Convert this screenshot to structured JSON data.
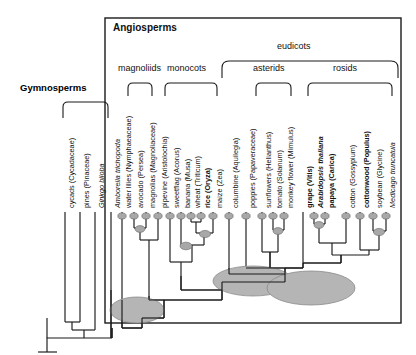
{
  "figure": {
    "title_labels": {
      "gymnosperms": "Gymnosperms",
      "angiosperms": "Angiosperms",
      "eudicots": "eudicots",
      "magnoliids": "magnoliids",
      "monocots": "monocots",
      "asterids": "asterids",
      "rosids": "rosids"
    },
    "colors": {
      "line": "#1a1a1a",
      "box": "#1a1a1a",
      "duplication_fill": "#b3b3b3",
      "duplication_stroke": "#555555",
      "background": "#ffffff"
    }
  },
  "chart_data": {
    "type": "tree",
    "tip_count": 24,
    "tips": [
      {
        "id": "cycads",
        "label": "cycads (Cycadaceae)",
        "x": 65,
        "style": "normal",
        "group": "gymnosperms"
      },
      {
        "id": "pines",
        "label": "pines (Pinaceae)",
        "x": 80,
        "style": "normal",
        "group": "gymnosperms"
      },
      {
        "id": "ginkgo",
        "label": "Ginkgo biloba",
        "x": 95,
        "style": "italic",
        "group": "gymnosperms"
      },
      {
        "id": "amborella",
        "label": "Amborella trichopoda",
        "x": 111,
        "style": "italic",
        "group": "angiosperms"
      },
      {
        "id": "waterlilies",
        "label": "water lilies (Nymphaeaceae)",
        "x": 122,
        "style": "normal",
        "group": "angiosperms"
      },
      {
        "id": "avocado",
        "label": "avocado (Persea)",
        "x": 134,
        "style": "normal",
        "group": "magnoliids"
      },
      {
        "id": "magnolias",
        "label": "magnolias (Magnoliaceae)",
        "x": 146,
        "style": "normal",
        "group": "magnoliids"
      },
      {
        "id": "pipevine",
        "label": "pipevine (Aristolochia)",
        "x": 158,
        "style": "normal",
        "group": "magnoliids"
      },
      {
        "id": "sweetflag",
        "label": "sweetflag (Acorus)",
        "x": 170,
        "style": "normal",
        "group": "monocots"
      },
      {
        "id": "banana",
        "label": "banana (Musa)",
        "x": 181,
        "style": "normal",
        "group": "monocots"
      },
      {
        "id": "wheat",
        "label": "wheat (Triticum)",
        "x": 191,
        "style": "normal",
        "group": "monocots"
      },
      {
        "id": "rice",
        "label": "rice (Oryza)",
        "x": 201,
        "style": "bold",
        "group": "monocots"
      },
      {
        "id": "maize",
        "label": "maize (Zea)",
        "x": 213,
        "style": "normal",
        "group": "monocots"
      },
      {
        "id": "columbine",
        "label": "columbine (Aquilegia)",
        "x": 229,
        "style": "normal",
        "group": "eudicots"
      },
      {
        "id": "poppies",
        "label": "poppies (Papaveraceae)",
        "x": 246,
        "style": "normal",
        "group": "eudicots"
      },
      {
        "id": "sunflowers",
        "label": "sunflowers (Helianthus)",
        "x": 262,
        "style": "normal",
        "group": "asterids"
      },
      {
        "id": "tomato",
        "label": "tomato (Solanum)",
        "x": 273,
        "style": "normal",
        "group": "asterids"
      },
      {
        "id": "monkeyflower",
        "label": "monkey flower (Mimulus)",
        "x": 284,
        "style": "normal",
        "group": "asterids"
      },
      {
        "id": "grape",
        "label": "grape (Vitis)",
        "x": 303,
        "style": "bold",
        "group": "eudicots"
      },
      {
        "id": "arabidopsis",
        "label": "Arabidopsis thaliana",
        "x": 314,
        "style": "bolditalic",
        "group": "rosids"
      },
      {
        "id": "papaya",
        "label": "papaya (Carica)",
        "x": 325,
        "style": "bold",
        "group": "rosids"
      },
      {
        "id": "cotton",
        "label": "cotton (Gossypium)",
        "x": 346,
        "style": "normal",
        "group": "rosids"
      },
      {
        "id": "cottonwood",
        "label": "cottonwood (Populus)",
        "x": 360,
        "style": "bold",
        "group": "rosids"
      },
      {
        "id": "soybean",
        "label": "soybean (Glycine)",
        "x": 373,
        "style": "normal",
        "group": "rosids"
      },
      {
        "id": "medicago",
        "label": "Medicago truncatula",
        "x": 386,
        "style": "italic",
        "group": "rosids"
      }
    ],
    "clade_brackets": [
      {
        "id": "magnoliids",
        "label": "magnoliids",
        "x1": 128,
        "x2": 152,
        "y": 84,
        "label_y": 70
      },
      {
        "id": "monocots",
        "label": "monocots",
        "x1": 165,
        "x2": 217,
        "y": 84,
        "label_y": 70
      },
      {
        "id": "asterids",
        "label": "asterids",
        "x1": 256,
        "x2": 291,
        "y": 84,
        "label_y": 70
      },
      {
        "id": "rosids",
        "label": "rosids",
        "x1": 308,
        "x2": 392,
        "y": 84,
        "label_y": 70
      },
      {
        "id": "eudicots",
        "label": "eudicots",
        "x1": 222,
        "x2": 398,
        "y": 62,
        "label_y": 48
      }
    ],
    "duplication_events": {
      "description": "gray ellipses mark whole-genome duplication events",
      "small": [
        {
          "x": 122,
          "y": 216
        },
        {
          "x": 134,
          "y": 216
        },
        {
          "x": 146,
          "y": 216
        },
        {
          "x": 158,
          "y": 216
        },
        {
          "x": 170,
          "y": 216
        },
        {
          "x": 181,
          "y": 216
        },
        {
          "x": 191,
          "y": 216
        },
        {
          "x": 201,
          "y": 216
        },
        {
          "x": 213,
          "y": 216
        },
        {
          "x": 229,
          "y": 216
        },
        {
          "x": 246,
          "y": 216
        },
        {
          "x": 262,
          "y": 216
        },
        {
          "x": 273,
          "y": 216
        },
        {
          "x": 284,
          "y": 216
        },
        {
          "x": 314,
          "y": 216
        },
        {
          "x": 325,
          "y": 216
        },
        {
          "x": 346,
          "y": 216
        },
        {
          "x": 360,
          "y": 216
        },
        {
          "x": 373,
          "y": 216
        },
        {
          "x": 386,
          "y": 216
        },
        {
          "x": 140,
          "y": 228
        },
        {
          "x": 207,
          "y": 233
        },
        {
          "x": 278,
          "y": 230
        },
        {
          "x": 319,
          "y": 224
        },
        {
          "x": 379,
          "y": 231
        },
        {
          "x": 186,
          "y": 245
        }
      ],
      "large": [
        {
          "x": 137,
          "y": 310,
          "rx": 27,
          "ry": 13
        },
        {
          "x": 253,
          "y": 281,
          "rx": 40,
          "ry": 15
        },
        {
          "x": 311,
          "y": 288,
          "rx": 44,
          "ry": 17
        }
      ]
    }
  }
}
